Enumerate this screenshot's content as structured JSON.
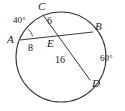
{
  "figure": {
    "type": "circle-geometry-diagram",
    "stroke_color": "#3a3a3a",
    "text_color": "#1a1a1a",
    "background_color": "#ffffff"
  },
  "circle": {
    "name": "circle-outline",
    "center_x": 61,
    "center_y": 57,
    "radius": 45
  },
  "points": [
    {
      "id": "A",
      "label": "A",
      "x": 20,
      "y": 40,
      "label_x": 7,
      "label_y": 34
    },
    {
      "id": "B",
      "label": "B",
      "x": 93,
      "y": 32,
      "label_x": 95,
      "label_y": 21
    },
    {
      "id": "C",
      "label": "C",
      "x": 43,
      "y": 15,
      "label_x": 38,
      "label_y": 1
    },
    {
      "id": "D",
      "label": "D",
      "x": 90,
      "y": 80,
      "label_x": 92,
      "label_y": 78
    },
    {
      "id": "E",
      "label": "E",
      "x": 46,
      "y": 37,
      "label_x": 47,
      "label_y": 38
    }
  ],
  "chords": [
    {
      "id": "AB",
      "from": "A",
      "to": "B",
      "name": "chord-ab"
    },
    {
      "id": "CD",
      "from": "C",
      "to": "D",
      "name": "chord-cd"
    }
  ],
  "segment_labels": [
    {
      "id": "AE",
      "value": "8",
      "x": 28,
      "y": 43
    },
    {
      "id": "CE",
      "value": "6",
      "x": 47,
      "y": 16
    },
    {
      "id": "ED",
      "value": "16",
      "x": 55,
      "y": 55
    }
  ],
  "angle_labels": [
    {
      "id": "angle-A",
      "value": "40°",
      "x": 13,
      "y": 16,
      "vertex": "A"
    },
    {
      "id": "angle-right",
      "value": "60°",
      "x": 100,
      "y": 54,
      "vertex": "arc-BD"
    }
  ],
  "angle_arcs": [
    {
      "id": "arc-at-A",
      "cx": 20,
      "cy": 40,
      "r": 13,
      "start_deg": -58,
      "end_deg": -18
    }
  ]
}
